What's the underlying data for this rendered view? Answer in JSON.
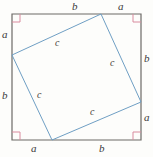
{
  "figure": {
    "colors": {
      "outer_square_stroke": "#6d6a66",
      "inner_square_stroke": "#6f9fc4",
      "right_angle_marker": "#d98b9e",
      "label_text": "#3a3a3a",
      "background": "#fdfdfb"
    },
    "outer_square": {
      "name": "outer-square",
      "stroke_width": 1.2,
      "points": "12,14 141,14 141,140 12,140"
    },
    "inner_square": {
      "name": "inner-square",
      "stroke_width": 1.0,
      "points": "101,14 141,102 52,140 12,55"
    },
    "right_angle_markers": [
      {
        "name": "right-angle-marker-top-left",
        "x": 12,
        "y": 14,
        "dx": 1,
        "dy": 1,
        "size": 8
      },
      {
        "name": "right-angle-marker-top-right",
        "x": 141,
        "y": 14,
        "dx": -1,
        "dy": 1,
        "size": 8
      },
      {
        "name": "right-angle-marker-bottom-left",
        "x": 12,
        "y": 140,
        "dx": 1,
        "dy": -1,
        "size": 8
      },
      {
        "name": "right-angle-marker-bottom-right",
        "x": 141,
        "y": 140,
        "dx": -1,
        "dy": -1,
        "size": 8
      }
    ],
    "labels": {
      "top_b": "b",
      "top_a": "a",
      "left_a": "a",
      "left_b": "b",
      "right_b": "b",
      "right_a": "a",
      "bottom_a": "a",
      "bottom_b": "b",
      "inner_c_top": "c",
      "inner_c_right": "c",
      "inner_c_left": "c",
      "inner_c_bottom": "c"
    }
  },
  "chart_data": {
    "type": "diagram",
    "outer_square_side": "a + b",
    "inner_square_side": "c",
    "segments": [
      {
        "edge": "top",
        "order": 1,
        "label": "b"
      },
      {
        "edge": "top",
        "order": 2,
        "label": "a"
      },
      {
        "edge": "right",
        "order": 1,
        "label": "b"
      },
      {
        "edge": "right",
        "order": 2,
        "label": "a"
      },
      {
        "edge": "bottom",
        "order": 1,
        "label": "a"
      },
      {
        "edge": "bottom",
        "order": 2,
        "label": "b"
      },
      {
        "edge": "left",
        "order": 1,
        "label": "a"
      },
      {
        "edge": "left",
        "order": 2,
        "label": "b"
      }
    ],
    "inner_edges": [
      {
        "position": "top-left-edge",
        "label": "c"
      },
      {
        "position": "top-right-edge",
        "label": "c"
      },
      {
        "position": "bottom-left-edge",
        "label": "c"
      },
      {
        "position": "bottom-right-edge",
        "label": "c"
      }
    ],
    "right_angle_count": 4,
    "legend": [],
    "xlabel": "",
    "ylabel": ""
  }
}
